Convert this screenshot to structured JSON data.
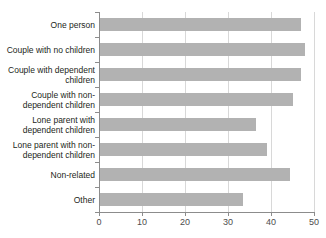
{
  "chart_data": {
    "type": "bar",
    "orientation": "horizontal",
    "title": "",
    "xlabel": "",
    "ylabel": "",
    "xlim": [
      0,
      50
    ],
    "xticks": [
      0,
      10,
      20,
      30,
      40,
      50
    ],
    "xtick_labels": [
      "0",
      "10",
      "20",
      "30",
      "40",
      "50"
    ],
    "grid": true,
    "grid_axis": "x",
    "legend": false,
    "bar_color": "#b2b2b2",
    "axis_color": "#8c8c8c",
    "grid_color": "#d8d8d8",
    "categories": [
      "One person",
      "Couple with no children",
      "Couple with dependent\nchildren",
      "Couple with non-\ndependent children",
      "Lone parent with\ndependent children",
      "Lone parent with non-\ndependent children",
      "Non-related",
      "Other"
    ],
    "values": [
      47,
      48,
      47,
      45,
      36.5,
      39,
      44.5,
      33.5
    ]
  },
  "clipped_header_text": ""
}
